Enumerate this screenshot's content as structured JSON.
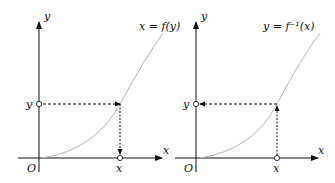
{
  "diagram": {
    "left_panel": {
      "curve_label": "x = f(y)",
      "x_axis_label": "x",
      "y_axis_label": "y",
      "origin_label": "O",
      "x_point_label": "x",
      "y_point_label": "y",
      "arrow_direction": "from y-axis to curve, then down to x-axis"
    },
    "right_panel": {
      "curve_label": "y = f⁻¹(x)",
      "x_axis_label": "x",
      "y_axis_label": "y",
      "origin_label": "O",
      "x_point_label": "x",
      "y_point_label": "y",
      "arrow_direction": "from x-axis up to curve, then left to y-axis"
    },
    "colors": {
      "axis": "#111111",
      "curve": "#b8b8b8",
      "dashed": "#111111"
    }
  }
}
